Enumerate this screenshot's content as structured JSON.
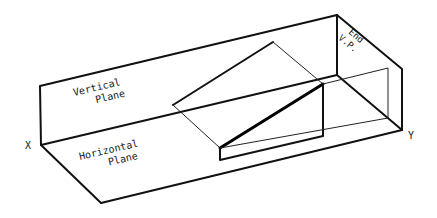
{
  "diagram": {
    "labels": {
      "vertical_plane_line1": "Vertical",
      "vertical_plane_line2": "Plane",
      "horizontal_plane_line1": "Horizontal",
      "horizontal_plane_line2": "Plane",
      "end_vp_line1": "End",
      "end_vp_line2": "V.P.",
      "x_point": "X",
      "y_point": "Y"
    },
    "colors": {
      "line": "#111111",
      "background": "#ffffff"
    }
  }
}
